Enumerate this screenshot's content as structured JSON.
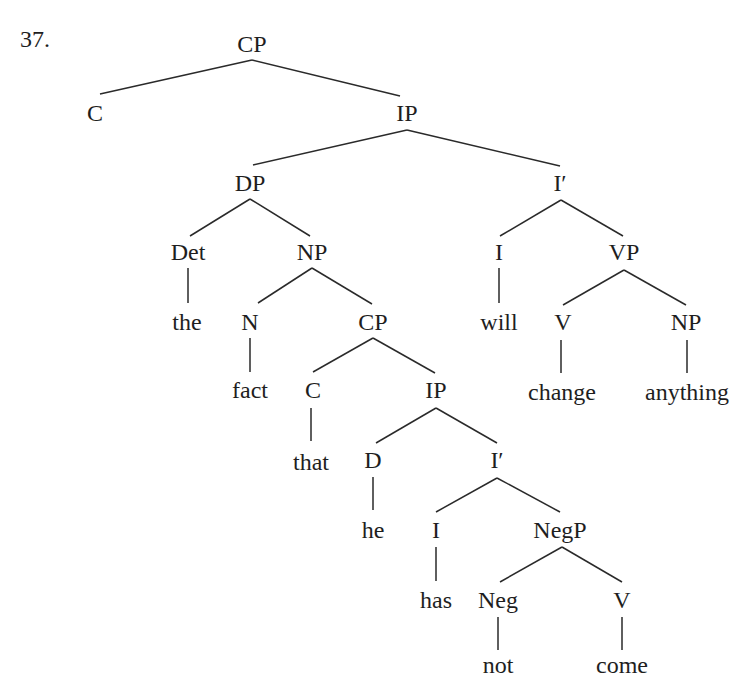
{
  "example_number": "37.",
  "tree": {
    "nodes": [
      {
        "id": "cp1",
        "label": "CP",
        "x": 252,
        "y": 44
      },
      {
        "id": "c1",
        "label": "C",
        "x": 95,
        "y": 113
      },
      {
        "id": "ip1",
        "label": "IP",
        "x": 407,
        "y": 113
      },
      {
        "id": "dp",
        "label": "DP",
        "x": 250,
        "y": 183
      },
      {
        "id": "ibar1",
        "label": "I′",
        "x": 560,
        "y": 183
      },
      {
        "id": "det",
        "label": "Det",
        "x": 188,
        "y": 252
      },
      {
        "id": "np1",
        "label": "NP",
        "x": 312,
        "y": 252
      },
      {
        "id": "i1",
        "label": "I",
        "x": 499,
        "y": 252
      },
      {
        "id": "vp",
        "label": "VP",
        "x": 624,
        "y": 252
      },
      {
        "id": "the",
        "label": "the",
        "x": 187,
        "y": 322
      },
      {
        "id": "n",
        "label": "N",
        "x": 250,
        "y": 322
      },
      {
        "id": "cp2",
        "label": "CP",
        "x": 373,
        "y": 322
      },
      {
        "id": "will",
        "label": "will",
        "x": 499,
        "y": 322
      },
      {
        "id": "v1",
        "label": "V",
        "x": 563,
        "y": 322
      },
      {
        "id": "np2",
        "label": "NP",
        "x": 686,
        "y": 322
      },
      {
        "id": "fact",
        "label": "fact",
        "x": 250,
        "y": 390
      },
      {
        "id": "c2",
        "label": "C",
        "x": 313,
        "y": 390
      },
      {
        "id": "ip2",
        "label": "IP",
        "x": 436,
        "y": 390
      },
      {
        "id": "change",
        "label": "change",
        "x": 562,
        "y": 392
      },
      {
        "id": "anything",
        "label": "anything",
        "x": 687,
        "y": 392
      },
      {
        "id": "that",
        "label": "that",
        "x": 311,
        "y": 462
      },
      {
        "id": "d",
        "label": "D",
        "x": 373,
        "y": 460
      },
      {
        "id": "ibar2",
        "label": "I′",
        "x": 497,
        "y": 460
      },
      {
        "id": "he",
        "label": "he",
        "x": 373,
        "y": 530
      },
      {
        "id": "i2",
        "label": "I",
        "x": 436,
        "y": 530
      },
      {
        "id": "negp",
        "label": "NegP",
        "x": 560,
        "y": 530
      },
      {
        "id": "has",
        "label": "has",
        "x": 436,
        "y": 600
      },
      {
        "id": "neg",
        "label": "Neg",
        "x": 498,
        "y": 600
      },
      {
        "id": "v2",
        "label": "V",
        "x": 622,
        "y": 600
      },
      {
        "id": "not",
        "label": "not",
        "x": 498,
        "y": 665
      },
      {
        "id": "come",
        "label": "come",
        "x": 622,
        "y": 665
      }
    ],
    "edges": [
      {
        "from": [
          252,
          60
        ],
        "to": [
          100,
          94
        ]
      },
      {
        "from": [
          252,
          60
        ],
        "to": [
          400,
          96
        ]
      },
      {
        "from": [
          407,
          130
        ],
        "to": [
          253,
          165
        ]
      },
      {
        "from": [
          407,
          130
        ],
        "to": [
          560,
          166
        ]
      },
      {
        "from": [
          250,
          199
        ],
        "to": [
          190,
          236
        ]
      },
      {
        "from": [
          250,
          199
        ],
        "to": [
          310,
          236
        ]
      },
      {
        "from": [
          561,
          200
        ],
        "to": [
          500,
          236
        ]
      },
      {
        "from": [
          561,
          200
        ],
        "to": [
          623,
          236
        ]
      },
      {
        "from": [
          188,
          268
        ],
        "to": [
          188,
          303
        ]
      },
      {
        "from": [
          312,
          268
        ],
        "to": [
          258,
          303
        ]
      },
      {
        "from": [
          312,
          268
        ],
        "to": [
          372,
          304
        ]
      },
      {
        "from": [
          499,
          268
        ],
        "to": [
          499,
          303
        ]
      },
      {
        "from": [
          624,
          270
        ],
        "to": [
          563,
          305
        ]
      },
      {
        "from": [
          624,
          270
        ],
        "to": [
          686,
          305
        ]
      },
      {
        "from": [
          250,
          338
        ],
        "to": [
          250,
          372
        ]
      },
      {
        "from": [
          373,
          338
        ],
        "to": [
          313,
          372
        ]
      },
      {
        "from": [
          373,
          338
        ],
        "to": [
          435,
          373
        ]
      },
      {
        "from": [
          561,
          340
        ],
        "to": [
          561,
          373
        ]
      },
      {
        "from": [
          687,
          340
        ],
        "to": [
          687,
          373
        ]
      },
      {
        "from": [
          311,
          408
        ],
        "to": [
          311,
          441
        ]
      },
      {
        "from": [
          436,
          408
        ],
        "to": [
          376,
          443
        ]
      },
      {
        "from": [
          436,
          408
        ],
        "to": [
          497,
          443
        ]
      },
      {
        "from": [
          373,
          477
        ],
        "to": [
          373,
          510
        ]
      },
      {
        "from": [
          497,
          478
        ],
        "to": [
          436,
          512
        ]
      },
      {
        "from": [
          497,
          478
        ],
        "to": [
          560,
          512
        ]
      },
      {
        "from": [
          436,
          547
        ],
        "to": [
          436,
          581
        ]
      },
      {
        "from": [
          562,
          547
        ],
        "to": [
          500,
          582
        ]
      },
      {
        "from": [
          562,
          547
        ],
        "to": [
          622,
          582
        ]
      },
      {
        "from": [
          498,
          617
        ],
        "to": [
          498,
          650
        ]
      },
      {
        "from": [
          622,
          617
        ],
        "to": [
          622,
          650
        ]
      }
    ]
  }
}
